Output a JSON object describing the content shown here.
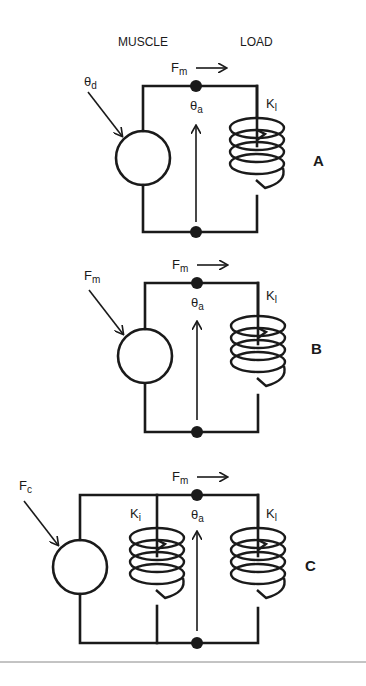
{
  "header": {
    "muscle": "MUSCLE",
    "load": "LOAD"
  },
  "panels": [
    {
      "id": "A",
      "label": "A",
      "input": {
        "sym": "θ",
        "sub": "d"
      },
      "force": {
        "sym": "F",
        "sub": "m"
      },
      "angle": {
        "sym": "θ",
        "sub": "a"
      },
      "spring_load": {
        "sym": "K",
        "sub": "l"
      }
    },
    {
      "id": "B",
      "label": "B",
      "input": {
        "sym": "F",
        "sub": "m"
      },
      "force": {
        "sym": "F",
        "sub": "m"
      },
      "angle": {
        "sym": "θ",
        "sub": "a"
      },
      "spring_load": {
        "sym": "K",
        "sub": "l"
      }
    },
    {
      "id": "C",
      "label": "C",
      "input": {
        "sym": "F",
        "sub": "c"
      },
      "force": {
        "sym": "F",
        "sub": "m"
      },
      "angle": {
        "sym": "θ",
        "sub": "a"
      },
      "spring_internal": {
        "sym": "K",
        "sub": "i"
      },
      "spring_load": {
        "sym": "K",
        "sub": "l"
      }
    }
  ],
  "colors": {
    "ink": "#1a1a1a",
    "rule": "#888888",
    "background": "#ffffff"
  }
}
